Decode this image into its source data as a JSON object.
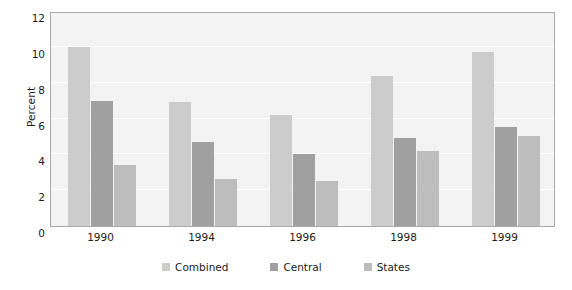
{
  "chart_data": {
    "type": "bar",
    "title": "",
    "xlabel": "",
    "ylabel": "Percent",
    "categories": [
      "1990",
      "1994",
      "1996",
      "1998",
      "1999"
    ],
    "series": [
      {
        "name": "Combined",
        "color": "#cccccc",
        "values": [
          10.0,
          6.9,
          6.2,
          8.4,
          9.7
        ]
      },
      {
        "name": "Central",
        "color": "#a0a0a0",
        "values": [
          7.0,
          4.7,
          4.0,
          4.9,
          5.5
        ]
      },
      {
        "name": "States",
        "color": "#bdbdbd",
        "values": [
          3.4,
          2.6,
          2.5,
          4.2,
          5.0
        ]
      }
    ],
    "ylim": [
      0,
      12
    ],
    "yticks": [
      0,
      2,
      4,
      6,
      8,
      10,
      12
    ],
    "ytick_labels": [
      "0",
      "2",
      "4",
      "6",
      "8",
      "10",
      "12"
    ],
    "grid": true,
    "grid_axis": "y",
    "legend_position": "bottom",
    "plot_background": "#f3f3f3",
    "gridline_color": "#ffffff",
    "frame_color": "#a9a9a9",
    "text_color": "#1b1b1b"
  }
}
